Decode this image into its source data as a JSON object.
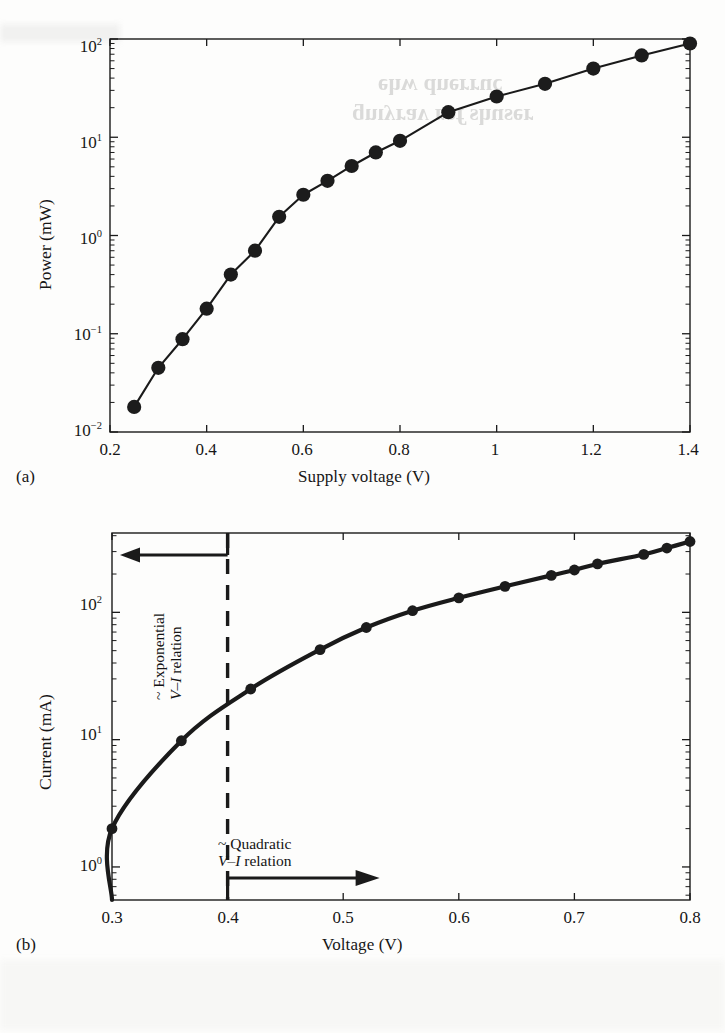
{
  "figure": {
    "panel_a_tag": "(a)",
    "panel_b_tag": "(b)"
  },
  "chart_data": [
    {
      "id": "panel-a",
      "type": "line",
      "title": "",
      "panel": "(a)",
      "xlabel": "Supply voltage (V)",
      "ylabel": "Power (mW)",
      "xscale": "linear",
      "yscale": "log",
      "xlim": [
        0.2,
        1.4
      ],
      "ylim": [
        0.01,
        100
      ],
      "grid": false,
      "legend": null,
      "xticks": [
        0.2,
        0.4,
        0.6,
        0.8,
        1,
        1.2,
        1.4
      ],
      "xtick_labels": [
        "0.2",
        "0.4",
        "0.6",
        "0.8",
        "1",
        "1.2",
        "1.4"
      ],
      "yticks": [
        0.01,
        0.1,
        1,
        10,
        100
      ],
      "ytick_labels": [
        "10-2",
        "10-1",
        "100",
        "101",
        "102"
      ],
      "ytick_bases": [
        "10",
        "10",
        "10",
        "10",
        "10"
      ],
      "ytick_exponents": [
        "-2",
        "-1",
        "0",
        "1",
        "2"
      ],
      "marker": "filled-circle",
      "x": [
        0.25,
        0.3,
        0.35,
        0.4,
        0.45,
        0.5,
        0.55,
        0.6,
        0.65,
        0.7,
        0.75,
        0.8,
        0.9,
        1.0,
        1.1,
        1.2,
        1.3,
        1.4
      ],
      "y": [
        0.018,
        0.045,
        0.088,
        0.18,
        0.4,
        0.7,
        1.55,
        2.6,
        3.6,
        5.1,
        7.0,
        9.2,
        18.0,
        26.0,
        35.0,
        50.0,
        68.0,
        90.0
      ]
    },
    {
      "id": "panel-b",
      "type": "line",
      "title": "",
      "panel": "(b)",
      "xlabel": "Voltage (V)",
      "ylabel": "Current (mA)",
      "xscale": "linear",
      "yscale": "log",
      "xlim": [
        0.3,
        0.8
      ],
      "ylim": [
        0.55,
        420
      ],
      "grid": false,
      "legend": null,
      "xticks": [
        0.3,
        0.4,
        0.5,
        0.6,
        0.7,
        0.8
      ],
      "xtick_labels": [
        "0.3",
        "0.4",
        "0.5",
        "0.6",
        "0.7",
        "0.8"
      ],
      "yticks": [
        1,
        10,
        100
      ],
      "ytick_labels": [
        "100",
        "101",
        "102"
      ],
      "ytick_bases": [
        "10",
        "10",
        "10"
      ],
      "ytick_exponents": [
        "0",
        "1",
        "2"
      ],
      "marker": "filled-circle",
      "x": [
        0.3,
        0.36,
        0.42,
        0.48,
        0.52,
        0.56,
        0.6,
        0.64,
        0.68,
        0.7,
        0.72,
        0.76,
        0.78,
        0.8
      ],
      "y": [
        2.0,
        9.8,
        25.0,
        51.0,
        76.0,
        103.0,
        130.0,
        160.0,
        195.0,
        215.0,
        240.0,
        285.0,
        320.0,
        360.0
      ],
      "curve_fit": true,
      "divider": {
        "x": 0.4,
        "style": "dashed",
        "label": "regime boundary"
      },
      "annotations": [
        {
          "id": "exponential",
          "line1": "~ Exponential",
          "line2_italic": "V–I",
          "line2_rest": " relation",
          "text": "~ Exponential V–I relation",
          "orientation": "vertical",
          "arrow": "left"
        },
        {
          "id": "quadratic",
          "line1": "~ Quadratic",
          "line2_italic": "V–I",
          "line2_rest": " relation",
          "text": "~ Quadratic V–I relation",
          "orientation": "horizontal",
          "arrow": "right"
        }
      ]
    }
  ],
  "style": {
    "ink": "#1a1a1a",
    "page_background": "#fdfdfc",
    "marker_fill": "#1c1c1c",
    "line_color": "#1c1c1c"
  }
}
